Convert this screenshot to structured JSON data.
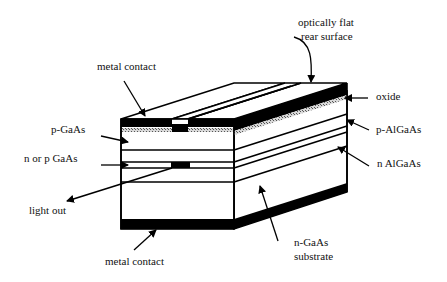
{
  "diagram": {
    "type": "laser-diode-cross-section",
    "labels": {
      "optically_flat_line1": "optically flat",
      "optically_flat_line2": "rear surface",
      "metal_contact_top": "metal contact",
      "oxide": "oxide",
      "p_gaas": "p-GaAs",
      "p_algaas": "p-AlGaAs",
      "n_or_p_gaas": "n or p GaAs",
      "n_algaas": "n AlGaAs",
      "light_out": "light out",
      "n_gaas_line1": "n-GaAs",
      "n_gaas_line2": "substrate",
      "metal_contact_bottom": "metal contact"
    },
    "colors": {
      "line": "#000000",
      "metal": "#000000",
      "oxide_hatch": "#9a9a9a",
      "background": "#ffffff"
    }
  }
}
